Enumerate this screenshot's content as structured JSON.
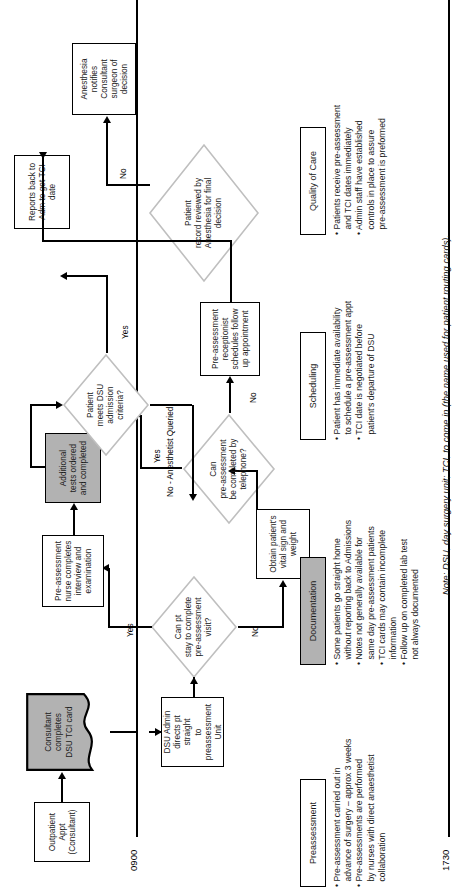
{
  "figure": {
    "note": "Note: DSU, day surgery unit; TCI, to come in (the name used for patient routing cards)."
  },
  "timeline": {
    "start_label": "0900",
    "end_label": "1730"
  },
  "nodes": {
    "outpatient_appt": "Outpatient\nAppt\n(Consultant)",
    "consultant_tci_card": "Consultant\ncompletes\nDSU TCI card",
    "dsu_admin_directs": "DSU Admin\ndirects pt straight\nto preassessment\nUnit",
    "can_pt_stay": "Can pt\nstay to complete\npre-assessment\nvisit?",
    "obtain_vitals": "Obtain patient's\nvital sign and\nweight",
    "nurse_interview": "Pre-assessment\nnurse completes\ninterview and\nexamination",
    "can_preassess_phone": "Can\npre-assessment\nbe completed by\ntelephone?",
    "receptionist_schedules": "Pre-assessment\nreceptionist\nschedules follow\nup appointment",
    "additional_tests": "Additional\ntests ordered\nand completed",
    "meets_dsu_criteria": "Patient\nmeets DSU\nadmission\ncriteria?",
    "reports_back_adm": "Reports back to\nAdm to get TCI\ndate",
    "record_reviewed": "Patient\nrecord reviewed by\nAnesthesia for final\ndecision",
    "anesthesia_notifies": "Anesthesia\nnotifies Consultant\nsurgeon of\ndecision"
  },
  "edge_labels": {
    "stay_yes": "Yes",
    "stay_no": "No",
    "phone_yes": "Yes",
    "phone_no": "No",
    "criteria_yes": "Yes",
    "criteria_no": "No - Anesthetist Queried",
    "review_no": "No"
  },
  "panels": [
    {
      "id": "preassessment",
      "title": "Preassessment",
      "shaded": false,
      "bullets": [
        "• Pre-assessment carried out in\nadvance of surgery – approx 3 weeks",
        "• Pre-assessments are performed\nby nurses with direct anaesthetist\ncollaboration"
      ]
    },
    {
      "id": "documentation",
      "title": "Documentation",
      "shaded": true,
      "bullets": [
        "• Some patients go straight home\nwithout reporting back to Admissions",
        "• Notes not generally available for\nsame day pre-assessment patients",
        "• TCI cards may contain incomplete\ninformation",
        "• Follow up on completed lab test\nnot always documented"
      ]
    },
    {
      "id": "scheduling",
      "title": "Scheduling",
      "shaded": false,
      "bullets": [
        "• Patient has immediate availability\nto schedule a pre-assessment appt",
        "• TCI date is negotiated before\npatient's departure of DSU"
      ]
    },
    {
      "id": "quality-of-care",
      "title": "Quality of Care",
      "shaded": false,
      "bullets": [
        "• Patients receive pre-assessment\nand TCI dates immediately",
        "• Admin staff have established\ncontrols in place to assure\npre-assessment is preformed"
      ]
    }
  ],
  "colors": {
    "shaded_fill": "#b2b2b2",
    "stroke": "#000000",
    "diamond_stroke": "#bfbfbf",
    "background": "#ffffff"
  }
}
